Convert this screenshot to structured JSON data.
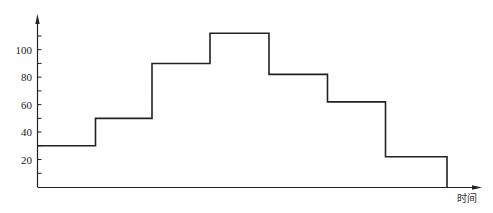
{
  "chart_data": {
    "type": "line",
    "subtype": "step",
    "title": "",
    "xlabel": "时间",
    "ylabel": "",
    "ylim": [
      0,
      120
    ],
    "grid": false,
    "legend": null,
    "y_ticks_labeled": [
      20,
      40,
      60,
      80,
      100
    ],
    "y_ticks_minor": [
      10,
      30,
      50,
      70,
      90,
      110
    ],
    "x_ticks": [],
    "segments": [
      {
        "index": 1,
        "value": 30
      },
      {
        "index": 2,
        "value": 50
      },
      {
        "index": 3,
        "value": 90
      },
      {
        "index": 4,
        "value": 112
      },
      {
        "index": 5,
        "value": 82
      },
      {
        "index": 6,
        "value": 62
      },
      {
        "index": 7,
        "value": 22
      }
    ],
    "values": [
      30,
      50,
      90,
      112,
      82,
      62,
      22
    ],
    "final_value": 0,
    "series": [
      {
        "name": "",
        "values": [
          30,
          50,
          90,
          112,
          82,
          62,
          22
        ],
        "color": "#222222"
      }
    ]
  },
  "axes": {
    "x_label": "时间",
    "y_tick_labels": [
      "20",
      "40",
      "60",
      "80",
      "100"
    ]
  },
  "colors": {
    "line": "#222222",
    "axis": "#222222",
    "background": "#ffffff"
  }
}
